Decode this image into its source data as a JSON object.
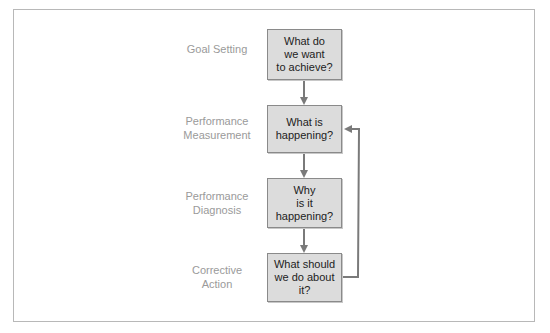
{
  "diagram": {
    "stages": [
      {
        "label": "Goal Setting",
        "question": "What do\nwe want\nto achieve?"
      },
      {
        "label": "Performance\nMeasurement",
        "question": "What is\nhappening?"
      },
      {
        "label": "Performance\nDiagnosis",
        "question": "Why\nis it\nhappening?"
      },
      {
        "label": "Corrective\nAction",
        "question": "What should\nwe do about\nit?"
      }
    ],
    "feedback_loop": {
      "from": "Corrective Action",
      "to": "Performance Measurement"
    },
    "colors": {
      "box_fill": "#dcdcdc",
      "box_border": "#8a8a8a",
      "arrow": "#7a7a7a",
      "label": "#9a9a9a"
    }
  }
}
